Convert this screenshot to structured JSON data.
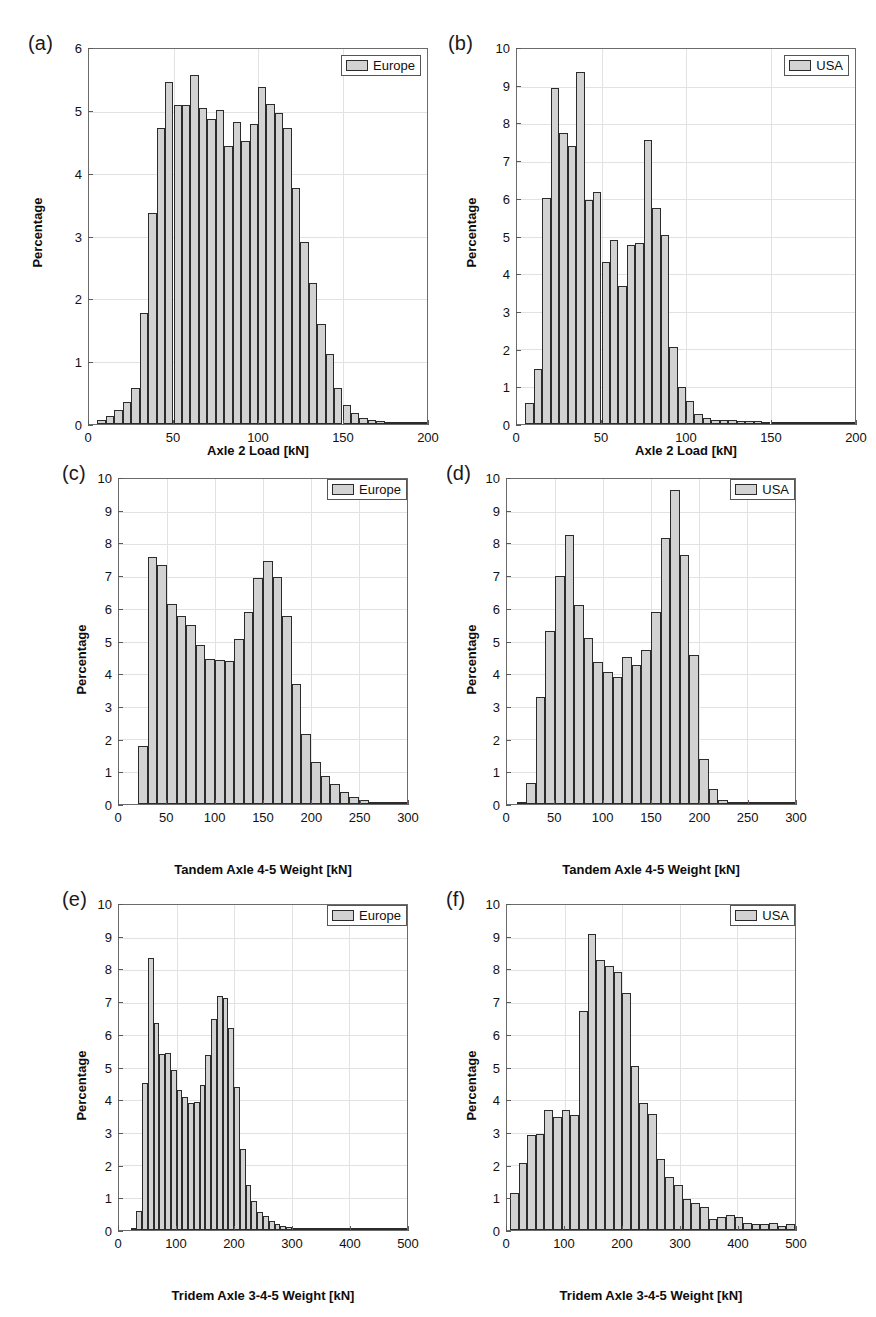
{
  "figure": {
    "panel_count": 6,
    "bar_fill": "#d2d2d2",
    "bar_edge": "#2b2b2b",
    "grid_color": "#e2e2e2",
    "axis_color": "#6b6b6b"
  },
  "panels": [
    {
      "tag": "(a)",
      "legend_label": "Europe",
      "ylabel": "Percentage",
      "xlabel": "Axle 2 Load [kN]",
      "ytick_labels": [
        "0",
        "1",
        "2",
        "3",
        "4",
        "5",
        "6"
      ],
      "xtick_labels": [
        "0",
        "50",
        "100",
        "150",
        "200"
      ]
    },
    {
      "tag": "(b)",
      "legend_label": "USA",
      "ylabel": "Percentage",
      "xlabel": "Axle 2 Load [kN]",
      "ytick_labels": [
        "0",
        "1",
        "2",
        "3",
        "4",
        "5",
        "6",
        "7",
        "8",
        "9",
        "10"
      ],
      "xtick_labels": [
        "0",
        "50",
        "100",
        "150",
        "200"
      ]
    },
    {
      "tag": "(c)",
      "legend_label": "Europe",
      "ylabel": "Percentage",
      "xlabel": "Tandem Axle 4-5 Weight [kN]",
      "ytick_labels": [
        "0",
        "1",
        "2",
        "3",
        "4",
        "5",
        "6",
        "7",
        "8",
        "9",
        "10"
      ],
      "xtick_labels": [
        "0",
        "50",
        "100",
        "150",
        "200",
        "250",
        "300"
      ]
    },
    {
      "tag": "(d)",
      "legend_label": "USA",
      "ylabel": "Percentage",
      "xlabel": "Tandem Axle 4-5 Weight [kN]",
      "ytick_labels": [
        "0",
        "1",
        "2",
        "3",
        "4",
        "5",
        "6",
        "7",
        "8",
        "9",
        "10"
      ],
      "xtick_labels": [
        "0",
        "50",
        "100",
        "150",
        "200",
        "250",
        "300"
      ]
    },
    {
      "tag": "(e)",
      "legend_label": "Europe",
      "ylabel": "Percentage",
      "xlabel": "Tridem Axle 3-4-5 Weight [kN]",
      "ytick_labels": [
        "0",
        "1",
        "2",
        "3",
        "4",
        "5",
        "6",
        "7",
        "8",
        "9",
        "10"
      ],
      "xtick_labels": [
        "0",
        "100",
        "200",
        "300",
        "400",
        "500"
      ]
    },
    {
      "tag": "(f)",
      "legend_label": "USA",
      "ylabel": "Percentage",
      "xlabel": "Tridem Axle 3-4-5 Weight [kN]",
      "ytick_labels": [
        "0",
        "1",
        "2",
        "3",
        "4",
        "5",
        "6",
        "7",
        "8",
        "9",
        "10"
      ],
      "xtick_labels": [
        "0",
        "100",
        "200",
        "300",
        "400",
        "500"
      ]
    }
  ],
  "chart_data": [
    {
      "id": "a",
      "type": "bar",
      "title": "(a)",
      "xlabel": "Axle 2 Load [kN]",
      "ylabel": "Percentage",
      "legend": [
        "Europe"
      ],
      "legend_position": "top-right",
      "grid": true,
      "xlim": [
        0,
        200
      ],
      "ylim": [
        0,
        6
      ],
      "xticks": [
        0,
        50,
        100,
        150,
        200
      ],
      "yticks": [
        0,
        1,
        2,
        3,
        4,
        5,
        6
      ],
      "bin_width": 5,
      "bin_starts": [
        5,
        10,
        15,
        20,
        25,
        30,
        35,
        40,
        45,
        50,
        55,
        60,
        65,
        70,
        75,
        80,
        85,
        90,
        95,
        100,
        105,
        110,
        115,
        120,
        125,
        130,
        135,
        140,
        145,
        150,
        155,
        160,
        165,
        170,
        175,
        180,
        185,
        190,
        195
      ],
      "values": [
        0.07,
        0.13,
        0.22,
        0.35,
        0.58,
        1.78,
        3.38,
        4.73,
        5.48,
        5.1,
        5.1,
        5.58,
        5.05,
        4.88,
        5.02,
        4.45,
        4.83,
        4.53,
        4.8,
        5.4,
        5.12,
        4.98,
        4.73,
        3.78,
        2.92,
        2.25,
        1.6,
        1.12,
        0.58,
        0.3,
        0.17,
        0.1,
        0.07,
        0.05,
        0.04,
        0.03,
        0.02,
        0.02,
        0.01
      ]
    },
    {
      "id": "b",
      "type": "bar",
      "title": "(b)",
      "xlabel": "Axle 2 Load [kN]",
      "ylabel": "Percentage",
      "legend": [
        "USA"
      ],
      "legend_position": "top-right",
      "grid": true,
      "xlim": [
        0,
        200
      ],
      "ylim": [
        0,
        10
      ],
      "xticks": [
        0,
        50,
        100,
        150,
        200
      ],
      "yticks": [
        0,
        1,
        2,
        3,
        4,
        5,
        6,
        7,
        8,
        9,
        10
      ],
      "bin_width": 5,
      "bin_starts": [
        5,
        10,
        15,
        20,
        25,
        30,
        35,
        40,
        45,
        50,
        55,
        60,
        65,
        70,
        75,
        80,
        85,
        90,
        95,
        100,
        105,
        110,
        115,
        120,
        125,
        130,
        135,
        140,
        145,
        150,
        155,
        160,
        165,
        170,
        175,
        180,
        185,
        190,
        195
      ],
      "values": [
        0.55,
        1.47,
        6.02,
        8.95,
        7.75,
        7.42,
        9.38,
        5.98,
        6.18,
        4.32,
        4.9,
        3.67,
        4.77,
        4.82,
        7.58,
        5.77,
        5.05,
        2.05,
        1.0,
        0.62,
        0.28,
        0.15,
        0.12,
        0.12,
        0.1,
        0.07,
        0.07,
        0.07,
        0.06,
        0.06,
        0.06,
        0.06,
        0.06,
        0.06,
        0.06,
        0.06,
        0.06,
        0.06,
        0.06
      ]
    },
    {
      "id": "c",
      "type": "bar",
      "title": "(c)",
      "xlabel": "Tandem Axle 4-5 Weight [kN]",
      "ylabel": "Percentage",
      "legend": [
        "Europe"
      ],
      "legend_position": "top-right",
      "grid": true,
      "xlim": [
        0,
        300
      ],
      "ylim": [
        0,
        10
      ],
      "xticks": [
        0,
        50,
        100,
        150,
        200,
        250,
        300
      ],
      "yticks": [
        0,
        1,
        2,
        3,
        4,
        5,
        6,
        7,
        8,
        9,
        10
      ],
      "bin_width": 10,
      "bin_starts": [
        20,
        30,
        40,
        50,
        60,
        70,
        80,
        90,
        100,
        110,
        120,
        130,
        140,
        150,
        160,
        170,
        180,
        190,
        200,
        210,
        220,
        230,
        240,
        250,
        260,
        270,
        280,
        290
      ],
      "values": [
        1.78,
        7.6,
        7.35,
        6.15,
        5.8,
        5.5,
        4.88,
        4.45,
        4.42,
        4.4,
        5.08,
        5.9,
        6.95,
        7.48,
        6.97,
        5.8,
        3.7,
        2.15,
        1.3,
        0.87,
        0.63,
        0.38,
        0.22,
        0.12,
        0.06,
        0.04,
        0.03,
        0.02
      ]
    },
    {
      "id": "d",
      "type": "bar",
      "title": "(d)",
      "xlabel": "Tandem Axle 4-5 Weight [kN]",
      "ylabel": "Percentage",
      "legend": [
        "USA"
      ],
      "legend_position": "top-right",
      "grid": true,
      "xlim": [
        0,
        300
      ],
      "ylim": [
        0,
        10
      ],
      "xticks": [
        0,
        50,
        100,
        150,
        200,
        250,
        300
      ],
      "yticks": [
        0,
        1,
        2,
        3,
        4,
        5,
        6,
        7,
        8,
        9,
        10
      ],
      "bin_width": 10,
      "bin_starts": [
        10,
        20,
        30,
        40,
        50,
        60,
        70,
        80,
        90,
        100,
        110,
        120,
        130,
        140,
        150,
        160,
        170,
        180,
        190,
        200,
        210,
        220,
        230,
        240,
        250,
        260,
        270,
        280,
        290
      ],
      "values": [
        0.07,
        0.65,
        3.3,
        5.33,
        7.03,
        8.28,
        6.12,
        5.12,
        4.37,
        4.05,
        3.92,
        4.52,
        4.28,
        4.75,
        5.9,
        8.2,
        9.65,
        7.67,
        4.57,
        1.4,
        0.45,
        0.13,
        0.07,
        0.04,
        0.03,
        0.03,
        0.02,
        0.02,
        0.02
      ]
    },
    {
      "id": "e",
      "type": "bar",
      "title": "(e)",
      "xlabel": "Tridem Axle 3-4-5 Weight [kN]",
      "ylabel": "Percentage",
      "legend": [
        "Europe"
      ],
      "legend_position": "top-right",
      "grid": true,
      "xlim": [
        0,
        500
      ],
      "ylim": [
        0,
        10
      ],
      "xticks": [
        0,
        100,
        200,
        300,
        400,
        500
      ],
      "yticks": [
        0,
        1,
        2,
        3,
        4,
        5,
        6,
        7,
        8,
        9,
        10
      ],
      "bin_width": 10,
      "bin_starts": [
        20,
        30,
        40,
        50,
        60,
        70,
        80,
        90,
        100,
        110,
        120,
        130,
        140,
        150,
        160,
        170,
        180,
        190,
        200,
        210,
        220,
        230,
        240,
        250,
        260,
        270,
        280,
        290,
        300,
        310,
        320,
        330,
        340,
        350,
        360,
        370,
        380,
        390,
        400,
        410,
        420,
        430,
        440,
        450,
        460,
        470,
        480,
        490
      ],
      "values": [
        0.05,
        0.6,
        4.53,
        8.38,
        6.38,
        5.42,
        5.45,
        4.92,
        4.3,
        4.1,
        3.9,
        3.95,
        4.45,
        5.4,
        6.48,
        7.2,
        7.15,
        6.22,
        4.4,
        2.5,
        1.4,
        0.9,
        0.55,
        0.42,
        0.28,
        0.2,
        0.12,
        0.08,
        0.06,
        0.05,
        0.04,
        0.04,
        0.03,
        0.03,
        0.03,
        0.02,
        0.02,
        0.02,
        0.02,
        0.02,
        0.02,
        0.02,
        0.02,
        0.02,
        0.02,
        0.02,
        0.02,
        0.02
      ]
    },
    {
      "id": "f",
      "type": "bar",
      "title": "(f)",
      "xlabel": "Tridem Axle 3-4-5 Weight [kN]",
      "ylabel": "Percentage",
      "legend": [
        "USA"
      ],
      "legend_position": "top-right",
      "grid": true,
      "xlim": [
        0,
        500
      ],
      "ylim": [
        0,
        10
      ],
      "xticks": [
        0,
        100,
        200,
        300,
        400,
        500
      ],
      "yticks": [
        0,
        1,
        2,
        3,
        4,
        5,
        6,
        7,
        8,
        9,
        10
      ],
      "bin_width": 15,
      "bin_starts": [
        5,
        20,
        35,
        50,
        65,
        80,
        95,
        110,
        125,
        140,
        155,
        170,
        185,
        200,
        215,
        230,
        245,
        260,
        275,
        290,
        305,
        320,
        335,
        350,
        365,
        380,
        395,
        410,
        425,
        440,
        455,
        470,
        485
      ],
      "values": [
        1.13,
        2.05,
        2.92,
        2.95,
        3.68,
        3.47,
        3.68,
        3.53,
        6.75,
        9.12,
        8.32,
        8.12,
        7.95,
        7.3,
        5.05,
        3.92,
        3.57,
        2.2,
        1.62,
        1.38,
        0.95,
        0.82,
        0.7,
        0.35,
        0.4,
        0.45,
        0.4,
        0.22,
        0.2,
        0.2,
        0.22,
        0.12,
        0.2
      ]
    }
  ]
}
